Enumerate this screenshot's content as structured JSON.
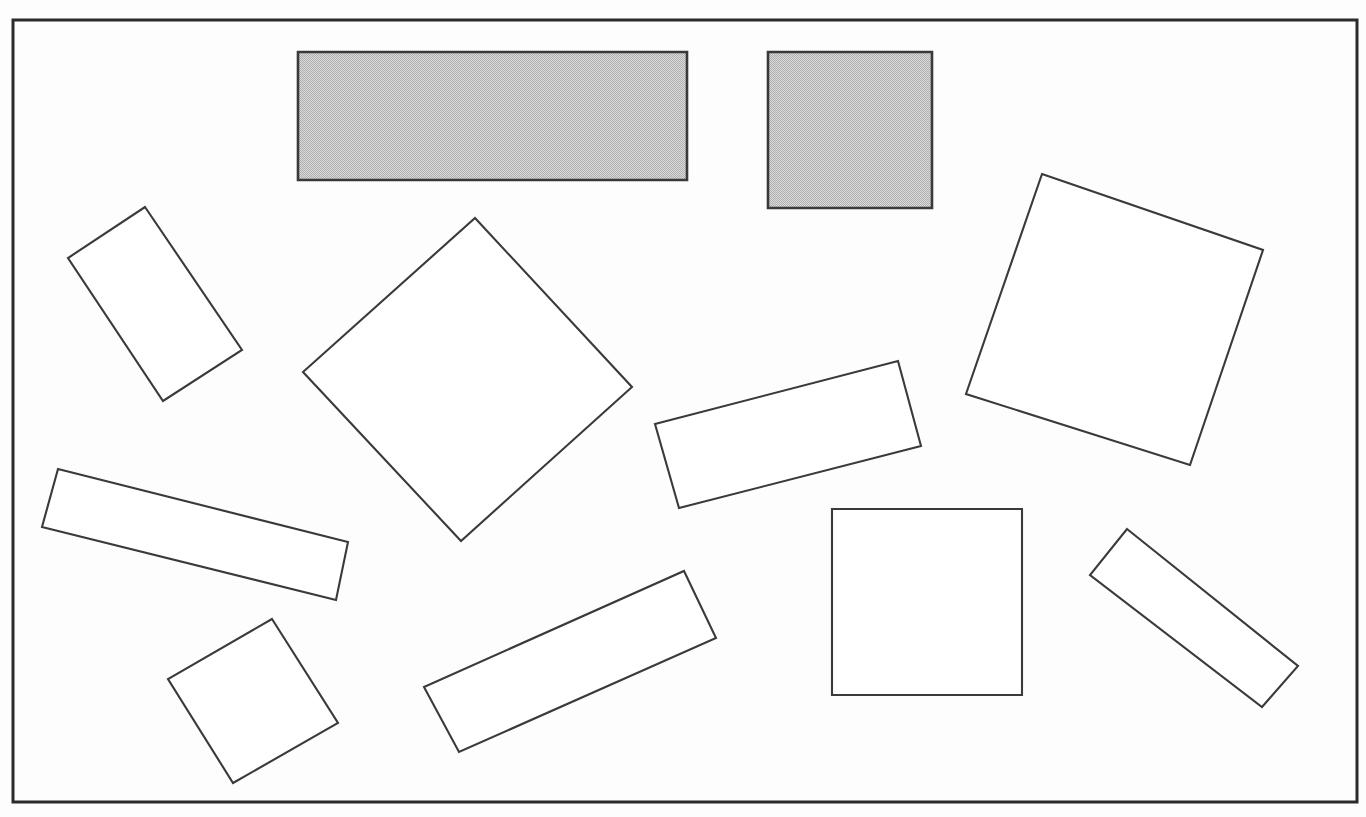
{
  "figure": {
    "background_color": "#fdfdfd",
    "canvas": {
      "width": 1366,
      "height": 817
    },
    "frame": {
      "name": "outer-border-frame",
      "x": 13,
      "y": 20,
      "width": 1344,
      "height": 782,
      "stroke_color": "#2b2b2b",
      "stroke_width": 3,
      "fill": "none"
    },
    "stroke_color": "#3a3a3a",
    "outline_fill": "#ffffff",
    "filled_fill": "#c8c8c8",
    "fill_style": "halftone-dither-gray"
  },
  "shapes": [
    {
      "id": "shape-1",
      "label": "gray-wide-rectangle",
      "type": "rectangle",
      "fill": "gray",
      "orientation": "axis-aligned",
      "points": "298,52 687,52 687,180 298,180"
    },
    {
      "id": "shape-2",
      "label": "gray-upright-rectangle",
      "type": "rectangle",
      "fill": "gray",
      "orientation": "axis-aligned",
      "points": "768,52 932,52 932,208 768,208"
    },
    {
      "id": "shape-3",
      "label": "tilted-tall-rectangle-upper-left",
      "type": "quadrilateral",
      "fill": "white",
      "orientation": "rotated",
      "points": "145,207 242,350 163,401 68,258"
    },
    {
      "id": "shape-4",
      "label": "large-diamond-center-left",
      "type": "quadrilateral",
      "fill": "white",
      "orientation": "rotated",
      "points": "475,218 632,387 461,541 303,372"
    },
    {
      "id": "shape-5",
      "label": "large-tilted-square-right",
      "type": "quadrilateral",
      "fill": "white",
      "orientation": "rotated",
      "points": "1042,174 1263,250 1190,465 966,394"
    },
    {
      "id": "shape-6",
      "label": "tilted-wide-rectangle-center",
      "type": "quadrilateral",
      "fill": "white",
      "orientation": "rotated",
      "points": "898,361 921,446 679,508 655,424"
    },
    {
      "id": "shape-7",
      "label": "long-tilted-rectangle-left",
      "type": "quadrilateral",
      "fill": "white",
      "orientation": "rotated",
      "points": "58,469 348,542 336,600 42,527"
    },
    {
      "id": "shape-8",
      "label": "small-tilted-square-lower-left",
      "type": "quadrilateral",
      "fill": "white",
      "orientation": "rotated",
      "points": "272,619 338,723 233,783 168,679"
    },
    {
      "id": "shape-9",
      "label": "long-diagonal-rectangle-bottom-center",
      "type": "quadrilateral",
      "fill": "white",
      "orientation": "rotated",
      "points": "684,571 716,638 459,752 424,687"
    },
    {
      "id": "shape-10",
      "label": "upright-rectangle-bottom-right",
      "type": "rectangle",
      "fill": "white",
      "orientation": "axis-aligned",
      "points": "832,509 1022,509 1022,695 832,695"
    },
    {
      "id": "shape-11",
      "label": "narrow-diagonal-rectangle-bottom-right",
      "type": "quadrilateral",
      "fill": "white",
      "orientation": "rotated",
      "points": "1127,529 1298,666 1262,707 1090,575"
    }
  ],
  "summary": {
    "total_shapes": 11,
    "filled_shapes": 2,
    "outline_shapes": 9
  }
}
